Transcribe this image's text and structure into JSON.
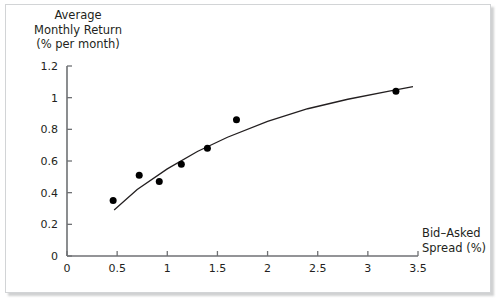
{
  "figure": {
    "background_color": "#ffffff",
    "frame_color": "#d2d4d6",
    "ink_color": "#231f20"
  },
  "labels": {
    "y_axis_title": "Average\nMonthly Return\n(% per month)",
    "x_axis_title": "Bid–Asked\nSpread (%)"
  },
  "chart_data": {
    "type": "scatter",
    "title": "",
    "xlabel": "Bid–Asked Spread (%)",
    "ylabel": "Average Monthly Return (% per month)",
    "xlim": [
      0,
      3.5
    ],
    "ylim": [
      0,
      1.2
    ],
    "xticks": [
      0,
      0.5,
      1,
      1.5,
      2,
      2.5,
      3,
      3.5
    ],
    "xtick_labels": [
      "0",
      "0.5",
      "1",
      "1.5",
      "2",
      "2.5",
      "3",
      "3.5"
    ],
    "yticks": [
      0,
      0.2,
      0.4,
      0.6,
      0.8,
      1,
      1.2
    ],
    "ytick_labels": [
      "0",
      "0.2",
      "0.4",
      "0.6",
      "0.8",
      "1",
      "1.2"
    ],
    "grid": false,
    "legend": null,
    "marker_color": "#000000",
    "marker_size": 7,
    "line_color": "#231f20",
    "series": [
      {
        "name": "Portfolio observations",
        "type": "scatter",
        "points": [
          {
            "x": 0.46,
            "y": 0.35
          },
          {
            "x": 0.72,
            "y": 0.51
          },
          {
            "x": 0.92,
            "y": 0.47
          },
          {
            "x": 1.14,
            "y": 0.58
          },
          {
            "x": 1.4,
            "y": 0.68
          },
          {
            "x": 1.69,
            "y": 0.86
          },
          {
            "x": 3.28,
            "y": 1.04
          }
        ]
      },
      {
        "name": "Fitted curve",
        "type": "line",
        "points": [
          {
            "x": 0.47,
            "y": 0.29
          },
          {
            "x": 0.7,
            "y": 0.42
          },
          {
            "x": 1.0,
            "y": 0.55
          },
          {
            "x": 1.3,
            "y": 0.66
          },
          {
            "x": 1.6,
            "y": 0.75
          },
          {
            "x": 2.0,
            "y": 0.85
          },
          {
            "x": 2.4,
            "y": 0.93
          },
          {
            "x": 2.8,
            "y": 0.99
          },
          {
            "x": 3.2,
            "y": 1.04
          },
          {
            "x": 3.45,
            "y": 1.07
          }
        ]
      }
    ]
  }
}
